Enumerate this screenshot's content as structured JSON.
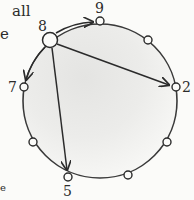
{
  "text_fragments": {
    "top_line": "all",
    "second_line": "e",
    "bottom_line": "e"
  },
  "diagram": {
    "type": "circular-graph",
    "center": [
      100,
      101
    ],
    "radius": 77,
    "fill": "shaded-gray-gradient",
    "nodes": [
      {
        "id": "8",
        "label": "8",
        "x": 50,
        "y": 40,
        "size": "large"
      },
      {
        "id": "9",
        "label": "9",
        "x": 100,
        "y": 21,
        "size": "small"
      },
      {
        "id": "n1",
        "label": "",
        "x": 148,
        "y": 40,
        "size": "small"
      },
      {
        "id": "2",
        "label": "2",
        "x": 176,
        "y": 87,
        "size": "small"
      },
      {
        "id": "n2",
        "label": "",
        "x": 167,
        "y": 142,
        "size": "small"
      },
      {
        "id": "n3",
        "label": "",
        "x": 128,
        "y": 175,
        "size": "small"
      },
      {
        "id": "5",
        "label": "5",
        "x": 68,
        "y": 177,
        "size": "small"
      },
      {
        "id": "n4",
        "label": "",
        "x": 33,
        "y": 142,
        "size": "small"
      },
      {
        "id": "7",
        "label": "7",
        "x": 24,
        "y": 87,
        "size": "small"
      }
    ],
    "arrows": [
      {
        "from": "8",
        "to": "9",
        "kind": "arc"
      },
      {
        "from": "8",
        "to": "7",
        "kind": "arc"
      },
      {
        "from": "8",
        "to": "2",
        "kind": "chord"
      },
      {
        "from": "8",
        "to": "5",
        "kind": "chord"
      }
    ],
    "labels": {
      "node_8": "8",
      "node_9": "9",
      "node_2": "2",
      "node_7": "7",
      "node_5": "5"
    }
  }
}
